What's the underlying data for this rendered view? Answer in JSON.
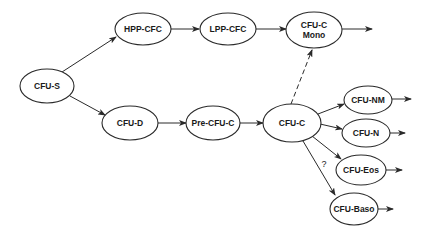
{
  "diagram": {
    "type": "flowchart",
    "nodes": [
      {
        "id": "cfu-s",
        "label_lines": [
          "CFU-S"
        ],
        "cx": 47,
        "cy": 86,
        "rx": 27,
        "ry": 17
      },
      {
        "id": "hpp-cfc",
        "label_lines": [
          "HPP-CFC"
        ],
        "cx": 143,
        "cy": 29,
        "rx": 28,
        "ry": 16
      },
      {
        "id": "lpp-cfc",
        "label_lines": [
          "LPP-CFC"
        ],
        "cx": 228,
        "cy": 29,
        "rx": 28,
        "ry": 16
      },
      {
        "id": "cfu-c-mono",
        "label_lines": [
          "CFU-C",
          "Mono"
        ],
        "cx": 314,
        "cy": 30,
        "rx": 28,
        "ry": 18
      },
      {
        "id": "cfu-d",
        "label_lines": [
          "CFU-D"
        ],
        "cx": 130,
        "cy": 123,
        "rx": 28,
        "ry": 17
      },
      {
        "id": "pre-cfu-c",
        "label_lines": [
          "Pre-CFU-C"
        ],
        "cx": 213,
        "cy": 123,
        "rx": 27,
        "ry": 17
      },
      {
        "id": "cfu-c",
        "label_lines": [
          "CFU-C"
        ],
        "cx": 292,
        "cy": 123,
        "rx": 29,
        "ry": 19
      },
      {
        "id": "cfu-nm",
        "label_lines": [
          "CFU-NM"
        ],
        "cx": 368,
        "cy": 100,
        "rx": 24,
        "ry": 14
      },
      {
        "id": "cfu-n",
        "label_lines": [
          "CFU-N"
        ],
        "cx": 366,
        "cy": 133,
        "rx": 24,
        "ry": 14
      },
      {
        "id": "cfu-eos",
        "label_lines": [
          "CFU-Eos"
        ],
        "cx": 361,
        "cy": 170,
        "rx": 25,
        "ry": 15
      },
      {
        "id": "cfu-baso",
        "label_lines": [
          "CFU-Baso"
        ],
        "cx": 354,
        "cy": 209,
        "rx": 24,
        "ry": 16
      }
    ],
    "edges": [
      {
        "from": "cfu-s",
        "to": "hpp-cfc",
        "x1": 62,
        "y1": 72,
        "x2": 116,
        "y2": 37,
        "style": "solid"
      },
      {
        "from": "cfu-s",
        "to": "cfu-d",
        "x1": 70,
        "y1": 96,
        "x2": 105,
        "y2": 115,
        "style": "solid"
      },
      {
        "from": "hpp-cfc",
        "to": "lpp-cfc",
        "x1": 171,
        "y1": 29,
        "x2": 199,
        "y2": 29,
        "style": "solid"
      },
      {
        "from": "lpp-cfc",
        "to": "cfu-c-mono",
        "x1": 256,
        "y1": 29,
        "x2": 286,
        "y2": 29,
        "style": "solid"
      },
      {
        "from": "cfu-c-mono",
        "to": "out",
        "x1": 342,
        "y1": 29,
        "x2": 372,
        "y2": 29,
        "style": "solid"
      },
      {
        "from": "cfu-d",
        "to": "pre-cfu-c",
        "x1": 158,
        "y1": 123,
        "x2": 186,
        "y2": 123,
        "style": "solid"
      },
      {
        "from": "pre-cfu-c",
        "to": "cfu-c",
        "x1": 240,
        "y1": 123,
        "x2": 263,
        "y2": 123,
        "style": "solid"
      },
      {
        "from": "cfu-c",
        "to": "cfu-c-mono",
        "x1": 291,
        "y1": 104,
        "x2": 312,
        "y2": 50,
        "style": "dashed"
      },
      {
        "from": "cfu-c",
        "to": "cfu-nm",
        "x1": 318,
        "y1": 114,
        "x2": 344,
        "y2": 104,
        "style": "solid"
      },
      {
        "from": "cfu-c",
        "to": "cfu-n",
        "x1": 320,
        "y1": 124,
        "x2": 342,
        "y2": 129,
        "style": "solid"
      },
      {
        "from": "cfu-c",
        "to": "cfu-eos",
        "x1": 312,
        "y1": 136,
        "x2": 341,
        "y2": 159,
        "style": "solid"
      },
      {
        "from": "cfu-c",
        "to": "cfu-baso",
        "x1": 303,
        "y1": 141,
        "x2": 335,
        "y2": 195,
        "style": "solid",
        "label": "?"
      },
      {
        "from": "cfu-nm",
        "to": "out",
        "x1": 392,
        "y1": 99,
        "x2": 411,
        "y2": 99,
        "style": "solid"
      },
      {
        "from": "cfu-n",
        "to": "out",
        "x1": 390,
        "y1": 133,
        "x2": 405,
        "y2": 133,
        "style": "solid"
      },
      {
        "from": "cfu-eos",
        "to": "out",
        "x1": 386,
        "y1": 170,
        "x2": 402,
        "y2": 170,
        "style": "solid"
      },
      {
        "from": "cfu-baso",
        "to": "out",
        "x1": 378,
        "y1": 209,
        "x2": 393,
        "y2": 209,
        "style": "solid"
      }
    ],
    "annotations": [
      {
        "text": "?",
        "x": 324,
        "y": 167
      }
    ]
  },
  "colors": {
    "background": "#ffffff",
    "stroke": "#2a2a2a",
    "text": "#1a1a1a"
  }
}
